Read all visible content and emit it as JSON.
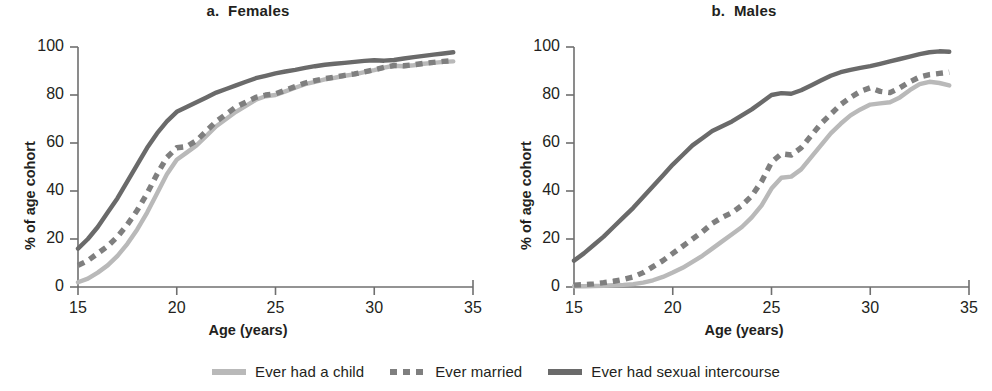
{
  "figure": {
    "x_axis_title": "Age (years)",
    "y_axis_title": "% of age cohort"
  },
  "legend": {
    "items": [
      {
        "label": "Ever had a child",
        "color": "#b9b9b9",
        "style": "solid"
      },
      {
        "label": "Ever married",
        "color": "#7f7f7f",
        "style": "dashed"
      },
      {
        "label": "Ever had sexual intercourse",
        "color": "#6a6a6a",
        "style": "solid"
      }
    ]
  },
  "panels": [
    {
      "title": "a.  Females"
    },
    {
      "title": "b.  Males"
    }
  ],
  "axes": {
    "x_ticks": [
      "15",
      "20",
      "25",
      "30",
      "35"
    ],
    "y_ticks": [
      "0",
      "20",
      "40",
      "60",
      "80",
      "100"
    ]
  },
  "chart_data": [
    {
      "type": "line",
      "title": "a.  Females",
      "xlabel": "Age (years)",
      "ylabel": "% of age cohort",
      "xlim": [
        15,
        35
      ],
      "ylim": [
        0,
        100
      ],
      "xticks": [
        15,
        20,
        25,
        30,
        35
      ],
      "yticks": [
        0,
        20,
        40,
        60,
        80,
        100
      ],
      "grid": false,
      "legend_position": "below-figure",
      "x": [
        15,
        15.5,
        16,
        16.5,
        17,
        17.5,
        18,
        18.5,
        19,
        19.5,
        20,
        20.5,
        21,
        21.5,
        22,
        22.5,
        23,
        23.5,
        24,
        24.5,
        25,
        25.5,
        26,
        26.5,
        27,
        27.5,
        28,
        28.5,
        29,
        29.5,
        30,
        30.5,
        31,
        31.5,
        32,
        32.5,
        33,
        33.5,
        34
      ],
      "series": [
        {
          "name": "Ever had sexual intercourse",
          "color": "#6a6a6a",
          "style": "solid",
          "values": [
            16,
            20,
            25,
            31,
            37,
            44,
            51,
            58,
            64,
            69,
            73,
            75,
            77,
            79,
            81,
            82.5,
            84,
            85.5,
            87,
            88,
            89,
            89.8,
            90.5,
            91.3,
            92,
            92.6,
            93,
            93.4,
            93.8,
            94.2,
            94.5,
            94.3,
            94.6,
            95.2,
            95.8,
            96.3,
            96.8,
            97.3,
            97.8
          ]
        },
        {
          "name": "Ever married",
          "color": "#7f7f7f",
          "style": "dashed",
          "values": [
            9,
            11,
            14,
            17,
            21,
            26,
            32,
            39,
            47,
            54,
            58,
            58.5,
            61,
            65,
            69,
            72,
            75,
            77,
            79,
            80,
            80.5,
            82,
            83.5,
            85,
            86,
            86.8,
            87.5,
            88.2,
            88.8,
            89.6,
            90.5,
            91.5,
            92.3,
            92.2,
            92.6,
            93.2,
            93.6,
            94,
            94.3
          ]
        },
        {
          "name": "Ever had a child",
          "color": "#b9b9b9",
          "style": "solid",
          "values": [
            2,
            3.5,
            6,
            9,
            13,
            18,
            24,
            31,
            39,
            47,
            53,
            56,
            59,
            63,
            67,
            70,
            73,
            75.5,
            78,
            79.5,
            80,
            81.5,
            83,
            84.5,
            85.5,
            86.5,
            87.2,
            88,
            88.6,
            89.5,
            90.4,
            91.4,
            92.2,
            92,
            92.4,
            93,
            93.4,
            93.8,
            94
          ]
        }
      ]
    },
    {
      "type": "line",
      "title": "b.  Males",
      "xlabel": "Age (years)",
      "ylabel": "% of age cohort",
      "xlim": [
        15,
        35
      ],
      "ylim": [
        0,
        100
      ],
      "xticks": [
        15,
        20,
        25,
        30,
        35
      ],
      "yticks": [
        0,
        20,
        40,
        60,
        80,
        100
      ],
      "grid": false,
      "legend_position": "below-figure",
      "x": [
        15,
        15.5,
        16,
        16.5,
        17,
        17.5,
        18,
        18.5,
        19,
        19.5,
        20,
        20.5,
        21,
        21.5,
        22,
        22.5,
        23,
        23.5,
        24,
        24.5,
        25,
        25.5,
        26,
        26.5,
        27,
        27.5,
        28,
        28.5,
        29,
        29.5,
        30,
        30.5,
        31,
        31.5,
        32,
        32.5,
        33,
        33.5,
        34
      ],
      "series": [
        {
          "name": "Ever had sexual intercourse",
          "color": "#6a6a6a",
          "style": "solid",
          "values": [
            11,
            14,
            17.5,
            21,
            25,
            29,
            33,
            37.5,
            42,
            46.5,
            51,
            55,
            59,
            62,
            65,
            67,
            69,
            71.5,
            74,
            77,
            80,
            80.8,
            80.5,
            82,
            84,
            86,
            88,
            89.5,
            90.5,
            91.3,
            92,
            93,
            94,
            95,
            96,
            97,
            97.8,
            98.2,
            98
          ]
        },
        {
          "name": "Ever married",
          "color": "#7f7f7f",
          "style": "dashed",
          "values": [
            0.8,
            1,
            1.3,
            1.8,
            2.4,
            3.2,
            4.2,
            6,
            8.5,
            11,
            14,
            17,
            20,
            23,
            26.5,
            29,
            31,
            34,
            38,
            44,
            52,
            55.5,
            55,
            58,
            63,
            68,
            72,
            76,
            79,
            81.5,
            83,
            81.5,
            81,
            83,
            85.5,
            87.5,
            88.5,
            89,
            89.5
          ]
        },
        {
          "name": "Ever had a child",
          "color": "#b9b9b9",
          "style": "solid",
          "values": [
            0.3,
            0.3,
            0.4,
            0.5,
            0.7,
            0.9,
            1.2,
            1.8,
            2.8,
            4.2,
            6,
            8,
            10.5,
            13,
            16,
            19,
            22,
            25,
            29,
            34,
            41,
            45.5,
            46,
            49,
            54,
            59,
            64,
            68,
            71.5,
            74,
            76,
            76.5,
            77,
            79,
            82,
            84.5,
            85.5,
            85,
            84
          ]
        }
      ]
    }
  ]
}
